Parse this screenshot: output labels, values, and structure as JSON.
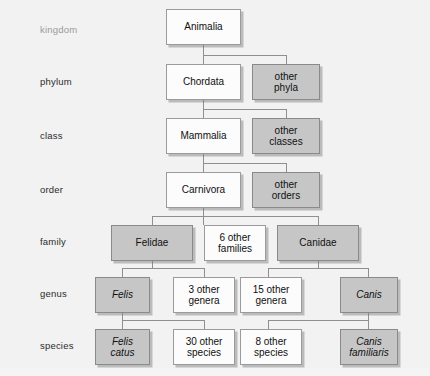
{
  "diagram": {
    "background_color": "#f2f2f2",
    "gray_fill": "#c6c6c6",
    "white_fill": "#fcfcfc",
    "border_color": "#8d8d8d",
    "line_color": "#8f8f8f"
  },
  "ranks": [
    {
      "label": "kingdom"
    },
    {
      "label": "phylum"
    },
    {
      "label": "class"
    },
    {
      "label": "order"
    },
    {
      "label": "family"
    },
    {
      "label": "genus"
    },
    {
      "label": "species"
    }
  ],
  "nodes": {
    "kingdom_animalia": {
      "line1": "Animalia",
      "line2": "",
      "fill": "white",
      "italic": false
    },
    "phylum_chordata": {
      "line1": "Chordata",
      "line2": "",
      "fill": "white",
      "italic": false
    },
    "phylum_other": {
      "line1": "other",
      "line2": "phyla",
      "fill": "gray",
      "italic": false
    },
    "class_mammalia": {
      "line1": "Mammalia",
      "line2": "",
      "fill": "white",
      "italic": false
    },
    "class_other": {
      "line1": "other",
      "line2": "classes",
      "fill": "gray",
      "italic": false
    },
    "order_carnivora": {
      "line1": "Carnivora",
      "line2": "",
      "fill": "white",
      "italic": false
    },
    "order_other": {
      "line1": "other",
      "line2": "orders",
      "fill": "gray",
      "italic": false
    },
    "family_felidae": {
      "line1": "Felidae",
      "line2": "",
      "fill": "gray",
      "italic": false
    },
    "family_other": {
      "line1": "6 other",
      "line2": "families",
      "fill": "white",
      "italic": false
    },
    "family_canidae": {
      "line1": "Canidae",
      "line2": "",
      "fill": "gray",
      "italic": false
    },
    "genus_felis": {
      "line1": "Felis",
      "line2": "",
      "fill": "gray",
      "italic": true
    },
    "genus_other_felidae": {
      "line1": "3 other",
      "line2": "genera",
      "fill": "white",
      "italic": false
    },
    "genus_other_canidae": {
      "line1": "15 other",
      "line2": "genera",
      "fill": "white",
      "italic": false
    },
    "genus_canis": {
      "line1": "Canis",
      "line2": "",
      "fill": "gray",
      "italic": true
    },
    "species_felis_catus": {
      "line1": "Felis",
      "line2": "catus",
      "fill": "gray",
      "italic": true
    },
    "species_other_felis": {
      "line1": "30 other",
      "line2": "species",
      "fill": "white",
      "italic": false
    },
    "species_other_canis": {
      "line1": "8 other",
      "line2": "species",
      "fill": "white",
      "italic": false
    },
    "species_canis_familiaris": {
      "line1": "Canis",
      "line2": "familiaris",
      "fill": "gray",
      "italic": true
    }
  }
}
